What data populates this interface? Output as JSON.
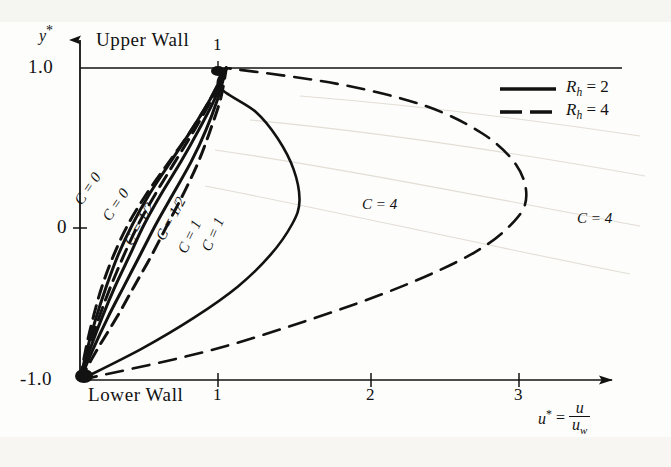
{
  "chart_data": {
    "type": "line",
    "title": "",
    "subtitle": "",
    "xlabel": "u* = u / u_w",
    "ylabel": "y*",
    "xlim": [
      0,
      3.6
    ],
    "ylim": [
      -1.0,
      1.0
    ],
    "grid": false,
    "legend_position": "top-right",
    "x_ticks": [
      1,
      2,
      3
    ],
    "x_tick_labels": [
      "1",
      "2",
      "3"
    ],
    "y_ticks": [
      -1.0,
      0,
      1.0
    ],
    "y_tick_labels": [
      "-1.0",
      "0",
      "1.0"
    ],
    "annotations": [
      {
        "text": "Upper  Wall",
        "x": 0.25,
        "y": 1.08
      },
      {
        "text": "Lower  Wall",
        "x": 0.25,
        "y": -1.12
      },
      {
        "text": "1",
        "x": 1.0,
        "y": 1.08
      }
    ],
    "series": [
      {
        "name": "C = 0, Rh = 4",
        "label": "C = 0",
        "C": 0,
        "Rh": 4,
        "style": "dashed",
        "points": [
          [
            0,
            -1.0
          ],
          [
            0.12,
            -0.8
          ],
          [
            0.25,
            -0.6
          ],
          [
            0.37,
            -0.4
          ],
          [
            0.49,
            -0.2
          ],
          [
            0.6,
            0.0
          ],
          [
            0.71,
            0.2
          ],
          [
            0.81,
            0.4
          ],
          [
            0.89,
            0.6
          ],
          [
            0.96,
            0.8
          ],
          [
            1.0,
            1.0
          ]
        ]
      },
      {
        "name": "C = 0, Rh = 2",
        "label": "C = 0",
        "C": 0,
        "Rh": 2,
        "style": "solid",
        "points": [
          [
            0,
            -1.0
          ],
          [
            0.09,
            -0.8
          ],
          [
            0.19,
            -0.6
          ],
          [
            0.3,
            -0.4
          ],
          [
            0.41,
            -0.2
          ],
          [
            0.52,
            0.0
          ],
          [
            0.64,
            0.2
          ],
          [
            0.76,
            0.4
          ],
          [
            0.86,
            0.6
          ],
          [
            0.94,
            0.8
          ],
          [
            1.0,
            1.0
          ]
        ]
      },
      {
        "name": "C = 1/2, Rh = 2",
        "label": "C = 1/2",
        "C": 0.5,
        "Rh": 2,
        "style": "solid",
        "points": [
          [
            0,
            -1.0
          ],
          [
            0.07,
            -0.8
          ],
          [
            0.15,
            -0.6
          ],
          [
            0.24,
            -0.4
          ],
          [
            0.34,
            -0.2
          ],
          [
            0.44,
            0.0
          ],
          [
            0.56,
            0.2
          ],
          [
            0.69,
            0.4
          ],
          [
            0.81,
            0.6
          ],
          [
            0.92,
            0.8
          ],
          [
            1.0,
            1.0
          ]
        ]
      },
      {
        "name": "C = 1/2, Rh = 4",
        "label": "C = 1/2",
        "C": 0.5,
        "Rh": 4,
        "style": "dashed",
        "points": [
          [
            0,
            -1.0
          ],
          [
            0.06,
            -0.8
          ],
          [
            0.13,
            -0.6
          ],
          [
            0.21,
            -0.4
          ],
          [
            0.3,
            -0.2
          ],
          [
            0.4,
            0.0
          ],
          [
            0.52,
            0.2
          ],
          [
            0.65,
            0.4
          ],
          [
            0.78,
            0.6
          ],
          [
            0.9,
            0.8
          ],
          [
            1.0,
            1.0
          ]
        ]
      },
      {
        "name": "C = 1, Rh = 2",
        "label": "C = 1",
        "C": 1,
        "Rh": 2,
        "style": "solid",
        "points": [
          [
            0,
            -1.0
          ],
          [
            0.05,
            -0.8
          ],
          [
            0.11,
            -0.6
          ],
          [
            0.18,
            -0.4
          ],
          [
            0.26,
            -0.2
          ],
          [
            0.36,
            0.0
          ],
          [
            0.48,
            0.2
          ],
          [
            0.62,
            0.4
          ],
          [
            0.76,
            0.6
          ],
          [
            0.89,
            0.8
          ],
          [
            1.0,
            1.0
          ]
        ]
      },
      {
        "name": "C = 1, Rh = 4",
        "label": "C = 1",
        "C": 1,
        "Rh": 4,
        "style": "dashed",
        "points": [
          [
            0,
            -1.0
          ],
          [
            0.04,
            -0.8
          ],
          [
            0.09,
            -0.6
          ],
          [
            0.15,
            -0.4
          ],
          [
            0.23,
            -0.2
          ],
          [
            0.33,
            0.0
          ],
          [
            0.46,
            0.2
          ],
          [
            0.61,
            0.4
          ],
          [
            0.76,
            0.6
          ],
          [
            0.89,
            0.8
          ],
          [
            1.0,
            1.0
          ]
        ]
      },
      {
        "name": "C = 4, Rh = 2",
        "label": "C = 4",
        "C": 4,
        "Rh": 2,
        "style": "solid",
        "points": [
          [
            0,
            -1.0
          ],
          [
            0.42,
            -0.8
          ],
          [
            0.78,
            -0.6
          ],
          [
            1.08,
            -0.4
          ],
          [
            1.3,
            -0.2
          ],
          [
            1.45,
            0.0
          ],
          [
            1.5,
            0.15
          ],
          [
            1.46,
            0.35
          ],
          [
            1.35,
            0.55
          ],
          [
            1.2,
            0.72
          ],
          [
            0.95,
            0.88
          ],
          [
            1.0,
            1.0
          ]
        ]
      },
      {
        "name": "C = 4, Rh = 4",
        "label": "C = 4",
        "C": 4,
        "Rh": 4,
        "style": "dashed",
        "points": [
          [
            0,
            -1.0
          ],
          [
            0.85,
            -0.82
          ],
          [
            1.55,
            -0.62
          ],
          [
            2.2,
            -0.4
          ],
          [
            2.7,
            -0.18
          ],
          [
            2.97,
            0.02
          ],
          [
            3.05,
            0.18
          ],
          [
            2.98,
            0.38
          ],
          [
            2.75,
            0.58
          ],
          [
            2.35,
            0.76
          ],
          [
            1.75,
            0.9
          ],
          [
            1.0,
            1.0
          ]
        ]
      }
    ],
    "curve_labels": [
      {
        "text": "C = 0",
        "px": 78,
        "py": 196,
        "rot": -56
      },
      {
        "text": "C = 0",
        "px": 106,
        "py": 212,
        "rot": -56
      },
      {
        "text": "C = 1/2",
        "px": 128,
        "py": 237,
        "rot": -60
      },
      {
        "text": "C = 1/2",
        "px": 160,
        "py": 232,
        "rot": -62
      },
      {
        "text": "C = 1",
        "px": 182,
        "py": 245,
        "rot": -64
      },
      {
        "text": "C = 1",
        "px": 206,
        "py": 243,
        "rot": -66
      }
    ],
    "c4_labels": [
      {
        "text": "C = 4",
        "px": 362,
        "py": 197
      },
      {
        "text": "C = 4",
        "px": 577,
        "py": 211
      }
    ],
    "legend": [
      {
        "label": "R",
        "sub": "h",
        "eq": "= 2",
        "style": "solid",
        "full": "R_h = 2"
      },
      {
        "label": "R",
        "sub": "h",
        "eq": "= 4",
        "style": "dashed",
        "full": "R_h = 4"
      }
    ]
  },
  "axes": {
    "y_label": "y",
    "y_star": "*",
    "y_top": "1.0",
    "y_mid": "0",
    "y_bot": "-1.0",
    "x_tick_1": "1",
    "x_tick_2": "2",
    "x_tick_3": "3",
    "top_label_1": "1",
    "upper_wall": "Upper  Wall",
    "lower_wall": "Lower  Wall",
    "x_label_u": "u",
    "x_label_star": "*",
    "x_label_eq": "=",
    "x_frac_num": "u",
    "x_frac_den_u": "u",
    "x_frac_den_sub": "w"
  },
  "colors": {
    "ink": "#121212",
    "paper": "#fdfdfb",
    "ghost": "#d8d6cf"
  }
}
